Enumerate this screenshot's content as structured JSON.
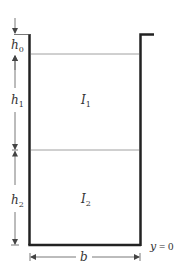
{
  "diagram": {
    "type": "two-layer fluid container cross-section",
    "colors": {
      "wall": "#222222",
      "interface": "#888888",
      "dimension": "#555555",
      "text": "#333333",
      "background": "#ffffff"
    },
    "labels": {
      "h0": {
        "main": "h",
        "sub": "0"
      },
      "h1": {
        "main": "h",
        "sub": "1"
      },
      "h2": {
        "main": "h",
        "sub": "2"
      },
      "I1": {
        "main": "I",
        "sub": "1"
      },
      "I2": {
        "main": "I",
        "sub": "2"
      },
      "b": "b",
      "y0_var": "y",
      "y0_eq": " = 0"
    },
    "layers": [
      {
        "name": "layer-1",
        "label": "I1",
        "height_label": "h1"
      },
      {
        "name": "layer-2",
        "label": "I2",
        "height_label": "h2"
      }
    ],
    "dimensions": [
      "h0",
      "h1",
      "h2",
      "b"
    ],
    "reference": "y = 0"
  }
}
